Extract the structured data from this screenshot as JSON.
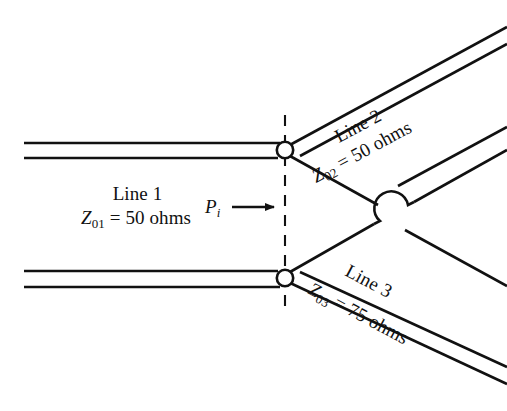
{
  "figure": {
    "background_color": "#ffffff",
    "line_color": "#111111"
  },
  "labels": {
    "line1_name": "Line 1",
    "line1_z_symbol": "Z",
    "line1_z_subscript": "01",
    "line1_z_value": "= 50 ohms",
    "incident_power_symbol": "P",
    "incident_power_subscript": "i",
    "line2_name": "Line 2",
    "line2_z_symbol": "Z",
    "line2_z_subscript": "02",
    "line2_z_value": "= 50 ohms",
    "line3_name": "Line 3",
    "line3_z_symbol": "Z",
    "line3_z_subscript": "03",
    "line3_z_value": "= 75 ohms"
  },
  "geometry": {
    "upper_node": {
      "x": 285,
      "y": 150
    },
    "lower_node": {
      "x": 285,
      "y": 278
    },
    "reference_plane_x": 285,
    "reference_plane_top_y": 115,
    "reference_plane_bottom_y": 313,
    "crossover_center": {
      "x": 395,
      "y": 213
    },
    "arrow_start_x": 232,
    "arrow_end_x": 281,
    "arrow_y": 207
  }
}
